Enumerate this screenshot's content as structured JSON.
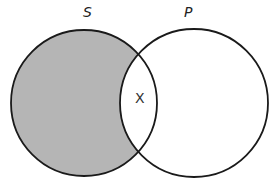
{
  "diagram": {
    "type": "venn",
    "sets": [
      {
        "label": "S",
        "shaded_region": "S only (outside P)"
      },
      {
        "label": "P",
        "shaded_region": "none"
      }
    ],
    "intersection_mark": "X",
    "colors": {
      "shade": "#b5b5b5",
      "stroke": "#1a1a1a",
      "background": "#ffffff"
    }
  }
}
